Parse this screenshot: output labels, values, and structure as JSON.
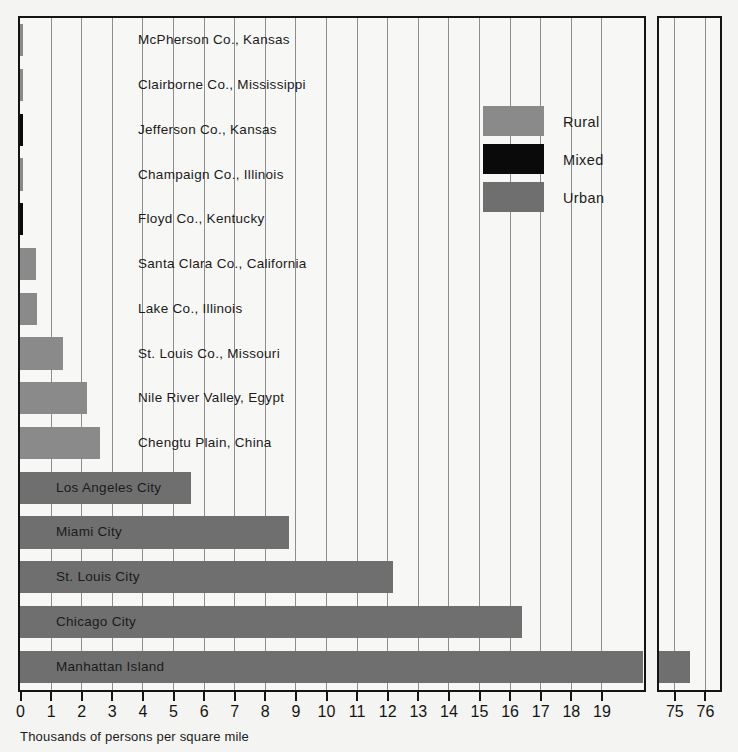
{
  "chart_data": {
    "type": "bar",
    "orientation": "horizontal",
    "title": "",
    "xlabel": "Thousands of persons per square mile",
    "ylabel": "",
    "xlim": [
      0,
      19
    ],
    "xticks": [
      0,
      1,
      2,
      3,
      4,
      5,
      6,
      7,
      8,
      9,
      10,
      11,
      12,
      13,
      14,
      15,
      16,
      17,
      18,
      19
    ],
    "xticklabels": [
      "0",
      "1",
      "2",
      "3",
      "4",
      "5",
      "6",
      "7",
      "8",
      "9",
      "10",
      "11",
      "12",
      "13",
      "14",
      "15",
      "16",
      "17",
      "18",
      "19"
    ],
    "broken_axis": {
      "enabled": true,
      "ticks": [
        75,
        76
      ],
      "ticklabels": [
        "75",
        "76"
      ]
    },
    "grid": true,
    "grid_axis": "x",
    "legend": {
      "position": "inside-upper-right",
      "entries": [
        {
          "label": "Rural",
          "color": "#8a8a8a"
        },
        {
          "label": "Mixed",
          "color": "#0a0a0a"
        },
        {
          "label": "Urban",
          "color": "#6f6f6f"
        }
      ]
    },
    "categories": [
      "McPherson Co., Kansas",
      "Clairborne Co., Mississippi",
      "Jefferson Co., Kansas",
      "Champaign Co., Illinois",
      "Floyd Co., Kentucky",
      "Santa Clara Co., California",
      "Lake Co., Illinois",
      "St. Louis Co., Missouri",
      "Nile River Valley, Egypt",
      "Chengtu Plain, China",
      "Los Angeles City",
      "Miami City",
      "St. Louis City",
      "Chicago City",
      "Manhattan Island"
    ],
    "values": [
      0.05,
      0.07,
      0.08,
      0.07,
      0.07,
      0.52,
      0.55,
      1.4,
      2.2,
      2.6,
      5.6,
      8.8,
      12.2,
      16.4,
      75.5
    ],
    "series": [
      {
        "name": "density",
        "values": [
          0.05,
          0.07,
          0.08,
          0.07,
          0.07,
          0.52,
          0.55,
          1.4,
          2.2,
          2.6,
          5.6,
          8.8,
          12.2,
          16.4,
          75.5
        ],
        "group": [
          "Rural",
          "Rural",
          "Mixed",
          "Rural",
          "Mixed",
          "Rural",
          "Rural",
          "Rural",
          "Rural",
          "Rural",
          "Urban",
          "Urban",
          "Urban",
          "Urban",
          "Urban"
        ]
      }
    ],
    "label_placement": [
      "outside",
      "outside",
      "outside",
      "outside",
      "outside",
      "outside",
      "outside",
      "outside",
      "outside",
      "outside",
      "inside",
      "inside",
      "inside",
      "inside",
      "inside"
    ]
  }
}
